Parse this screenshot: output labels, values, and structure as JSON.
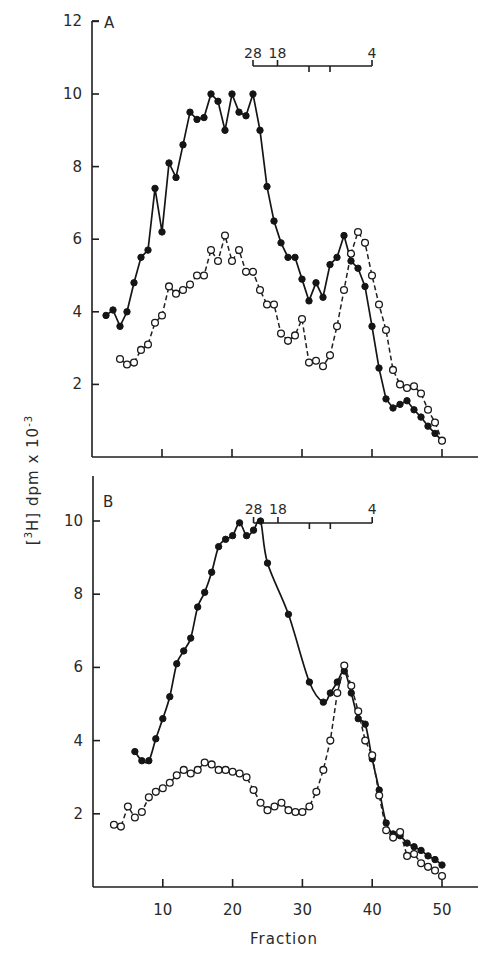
{
  "figure": {
    "y_axis_title": "[3H] dpm x 10-3",
    "y_axis_title_main": "[",
    "x_axis_title": "Fraction",
    "x_tick_labels": [
      "10",
      "20",
      "30",
      "40",
      "50"
    ],
    "panel_a": {
      "label": "A",
      "y_tick_labels": [
        "12",
        "10",
        "8",
        "6",
        "4",
        "2"
      ],
      "marker_labels": [
        "28",
        "18",
        "4"
      ]
    },
    "panel_b": {
      "label": "B",
      "y_tick_labels": [
        "10",
        "8",
        "6",
        "4",
        "2"
      ],
      "marker_labels": [
        "28",
        "18",
        "4"
      ]
    }
  },
  "chart_data": [
    {
      "type": "line",
      "title": "A",
      "xlabel": "Fraction",
      "ylabel": "[3H] dpm x 10^-3",
      "xlim": [
        0,
        55
      ],
      "ylim": [
        0,
        12
      ],
      "x_ticks": [
        10,
        20,
        30,
        40,
        50
      ],
      "y_ticks": [
        2,
        4,
        6,
        8,
        10,
        12
      ],
      "grid": false,
      "legend": "none",
      "sedimentation_markers": [
        {
          "label": "28",
          "fraction": 23
        },
        {
          "label": "18",
          "fraction": 26.5
        },
        {
          "label": "",
          "fraction": 31
        },
        {
          "label": "",
          "fraction": 34
        },
        {
          "label": "4",
          "fraction": 40
        }
      ],
      "series": [
        {
          "name": "closed circles (solid line)",
          "marker": "filled-circle",
          "x": [
            2,
            3,
            4,
            5,
            6,
            7,
            8,
            9,
            10,
            11,
            12,
            13,
            14,
            15,
            16,
            17,
            18,
            19,
            20,
            21,
            22,
            23,
            24,
            25,
            26,
            27,
            28,
            29,
            30,
            31,
            32,
            33,
            34,
            35,
            36,
            37,
            38,
            39,
            40,
            41,
            42,
            43,
            44,
            45,
            46,
            47,
            48,
            49,
            50
          ],
          "y": [
            3.9,
            4.05,
            3.6,
            4.0,
            4.8,
            5.5,
            5.7,
            7.4,
            6.2,
            8.1,
            7.7,
            8.6,
            9.5,
            9.3,
            9.35,
            10.0,
            9.8,
            9.0,
            10.0,
            9.5,
            9.4,
            10.0,
            9.0,
            7.45,
            6.5,
            5.9,
            5.5,
            5.5,
            4.9,
            4.3,
            4.8,
            4.4,
            5.3,
            5.5,
            6.1,
            5.4,
            5.2,
            4.7,
            3.6,
            2.45,
            1.6,
            1.35,
            1.45,
            1.55,
            1.3,
            1.1,
            0.85,
            0.65,
            0.45
          ]
        },
        {
          "name": "open circles (dashed line)",
          "marker": "open-circle",
          "x": [
            4,
            5,
            6,
            7,
            8,
            9,
            10,
            11,
            12,
            13,
            14,
            15,
            16,
            17,
            18,
            19,
            20,
            21,
            22,
            23,
            24,
            25,
            26,
            27,
            28,
            29,
            30,
            31,
            32,
            33,
            34,
            35,
            36,
            37,
            38,
            39,
            40,
            41,
            42,
            43,
            44,
            45,
            46,
            47,
            48,
            49,
            50
          ],
          "y": [
            2.7,
            2.55,
            2.6,
            2.95,
            3.1,
            3.7,
            3.9,
            4.7,
            4.5,
            4.6,
            4.75,
            5.0,
            5.0,
            5.7,
            5.4,
            6.1,
            5.4,
            5.7,
            5.1,
            5.1,
            4.6,
            4.2,
            4.2,
            3.4,
            3.2,
            3.35,
            3.8,
            2.6,
            2.65,
            2.5,
            2.8,
            3.6,
            4.6,
            5.6,
            6.2,
            5.9,
            5.0,
            4.2,
            3.5,
            2.4,
            2.0,
            1.9,
            1.95,
            1.75,
            1.3,
            0.95,
            0.45
          ]
        }
      ]
    },
    {
      "type": "line",
      "title": "B",
      "xlabel": "Fraction",
      "ylabel": "[3H] dpm x 10^-3",
      "xlim": [
        0,
        55
      ],
      "ylim": [
        0,
        11.2
      ],
      "x_ticks": [
        10,
        20,
        30,
        40,
        50
      ],
      "y_ticks": [
        2,
        4,
        6,
        8,
        10
      ],
      "grid": false,
      "legend": "none",
      "sedimentation_markers": [
        {
          "label": "28",
          "fraction": 23
        },
        {
          "label": "18",
          "fraction": 26.5
        },
        {
          "label": "",
          "fraction": 31
        },
        {
          "label": "",
          "fraction": 34
        },
        {
          "label": "4",
          "fraction": 40
        }
      ],
      "series": [
        {
          "name": "closed circles (solid line)",
          "marker": "filled-circle",
          "x": [
            6,
            7,
            8,
            9,
            10,
            11,
            12,
            13,
            14,
            15,
            16,
            17,
            18,
            19,
            20,
            21,
            22,
            23,
            24,
            25,
            28,
            31,
            33,
            34,
            35,
            36,
            37,
            38,
            39,
            40,
            41,
            42,
            43,
            44,
            45,
            46,
            47,
            48,
            49,
            50
          ],
          "y": [
            3.7,
            3.45,
            3.45,
            4.05,
            4.6,
            5.2,
            6.1,
            6.45,
            6.8,
            7.65,
            8.05,
            8.6,
            9.3,
            9.5,
            9.6,
            9.95,
            9.6,
            9.75,
            10.0,
            8.85,
            7.45,
            5.6,
            5.05,
            5.3,
            5.6,
            5.9,
            5.3,
            4.6,
            4.45,
            3.5,
            2.65,
            1.75,
            1.45,
            1.4,
            1.2,
            1.1,
            1.0,
            0.85,
            0.75,
            0.6
          ],
          "note": "solid line drawn as smooth curve through points"
        },
        {
          "name": "open circles (dashed line)",
          "marker": "open-circle",
          "x": [
            3,
            4,
            5,
            6,
            7,
            8,
            9,
            10,
            11,
            12,
            13,
            14,
            15,
            16,
            17,
            18,
            19,
            20,
            21,
            22,
            23,
            24,
            25,
            26,
            27,
            28,
            29,
            30,
            31,
            32,
            33,
            34,
            35,
            36,
            37,
            38,
            39,
            40,
            41,
            42,
            43,
            44,
            45,
            46,
            47,
            48,
            49,
            50
          ],
          "y": [
            1.7,
            1.65,
            2.2,
            1.9,
            2.05,
            2.45,
            2.6,
            2.7,
            2.85,
            3.05,
            3.2,
            3.1,
            3.2,
            3.4,
            3.35,
            3.2,
            3.2,
            3.15,
            3.1,
            3.0,
            2.65,
            2.3,
            2.1,
            2.2,
            2.3,
            2.1,
            2.05,
            2.05,
            2.2,
            2.6,
            3.2,
            4.0,
            5.3,
            6.05,
            5.5,
            4.8,
            4.0,
            3.6,
            2.5,
            1.55,
            1.35,
            1.5,
            0.85,
            0.9,
            0.65,
            0.55,
            0.45,
            0.3
          ]
        }
      ]
    }
  ]
}
